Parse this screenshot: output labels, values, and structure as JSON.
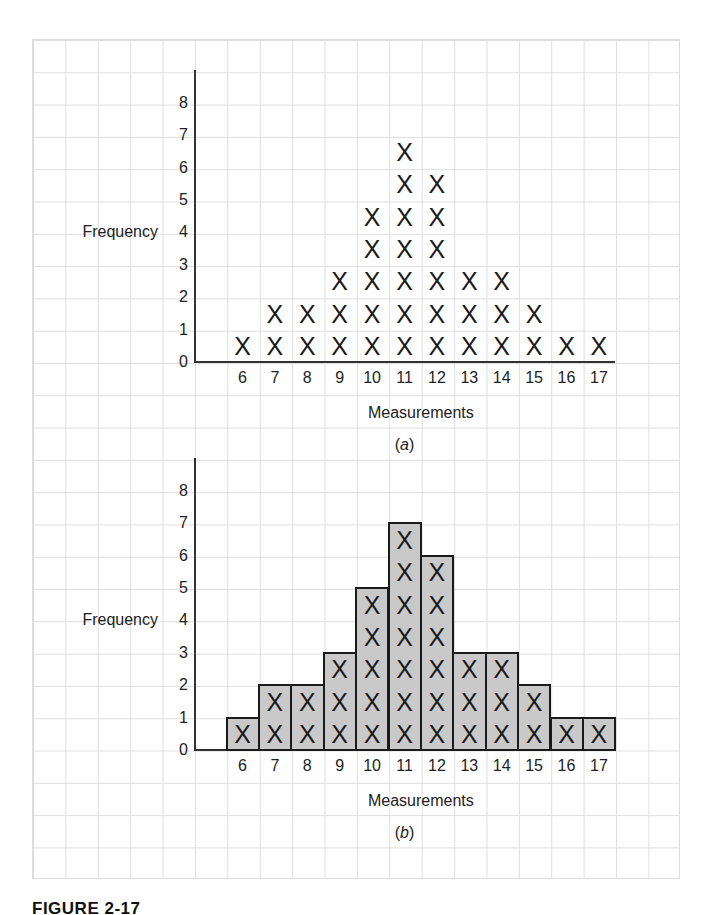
{
  "figure": {
    "caption": "FIGURE 2-17"
  },
  "colors": {
    "grid": "#dedede",
    "axis": "#333333",
    "bar_fill": "#c9c9c9",
    "bar_edge": "#1a1a1a",
    "text": "#1a1a1a"
  },
  "panels": [
    {
      "label": "a",
      "ylabel": "Frequency",
      "xlabel": "Measurements",
      "yticks": [
        "0",
        "1",
        "2",
        "3",
        "4",
        "5",
        "6",
        "7",
        "8"
      ],
      "xticks": [
        "6",
        "7",
        "8",
        "9",
        "10",
        "11",
        "12",
        "13",
        "14",
        "15",
        "16",
        "17"
      ]
    },
    {
      "label": "b",
      "ylabel": "Frequency",
      "xlabel": "Measurements",
      "yticks": [
        "0",
        "1",
        "2",
        "3",
        "4",
        "5",
        "6",
        "7",
        "8"
      ],
      "xticks": [
        "6",
        "7",
        "8",
        "9",
        "10",
        "11",
        "12",
        "13",
        "14",
        "15",
        "16",
        "17"
      ]
    }
  ],
  "chart_data": [
    {
      "type": "scatter",
      "subtype": "dot-plot (X marks)",
      "title": "(a)",
      "xlabel": "Measurements",
      "ylabel": "Frequency",
      "categories": [
        6,
        7,
        8,
        9,
        10,
        11,
        12,
        13,
        14,
        15,
        16,
        17
      ],
      "values": [
        1,
        2,
        2,
        3,
        5,
        7,
        6,
        3,
        3,
        2,
        1,
        1
      ],
      "marker": "X",
      "ylim": [
        0,
        8
      ],
      "yticks": [
        0,
        1,
        2,
        3,
        4,
        5,
        6,
        7,
        8
      ],
      "grid": true,
      "legend": null
    },
    {
      "type": "bar",
      "subtype": "histogram with X marks inside bars",
      "title": "(b)",
      "xlabel": "Measurements",
      "ylabel": "Frequency",
      "categories": [
        6,
        7,
        8,
        9,
        10,
        11,
        12,
        13,
        14,
        15,
        16,
        17
      ],
      "values": [
        1,
        2,
        2,
        3,
        5,
        7,
        6,
        3,
        3,
        2,
        1,
        1
      ],
      "marker": "X",
      "ylim": [
        0,
        8
      ],
      "yticks": [
        0,
        1,
        2,
        3,
        4,
        5,
        6,
        7,
        8
      ],
      "grid": true,
      "legend": null
    }
  ]
}
